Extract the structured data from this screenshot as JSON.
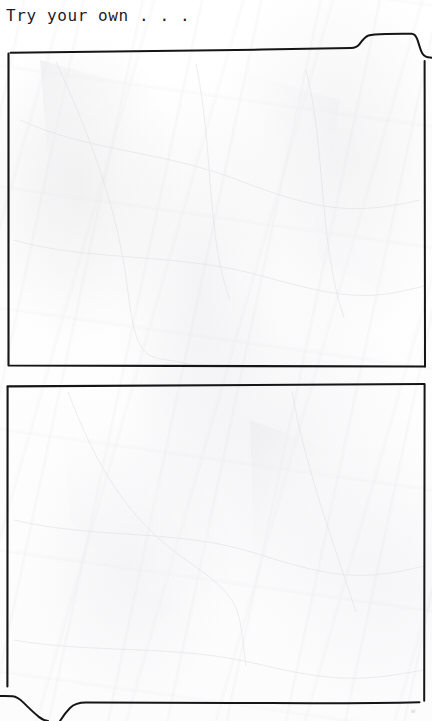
{
  "page": {
    "title": "Try your own . . .",
    "background_color": "#fdfdfd",
    "ink_color": "#151517",
    "medium": "crumpled white paper",
    "width": 432,
    "height": 721
  },
  "heading": {
    "text": "Try your own . . ."
  },
  "panels": [
    {
      "name": "panel-one",
      "label": "",
      "content": "",
      "has_tab_notch": true,
      "notch_position": "top-right",
      "notch_direction": "up"
    },
    {
      "name": "panel-two",
      "label": "",
      "content": "",
      "has_tab_notch": true,
      "notch_position": "bottom-left",
      "notch_direction": "down"
    }
  ],
  "corner_mark": {
    "text": "w"
  }
}
